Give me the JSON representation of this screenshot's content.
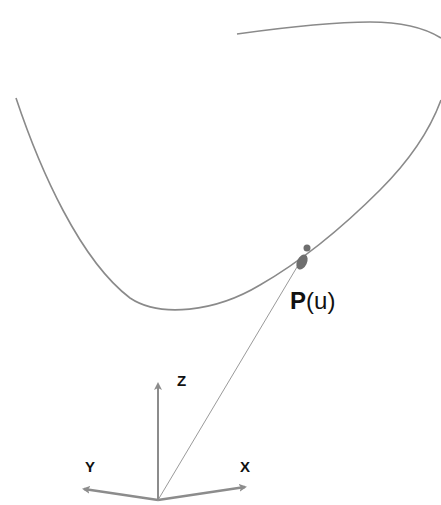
{
  "diagram": {
    "colors": {
      "curve": "#8a8a8a",
      "axes": "#8c8c8c",
      "vector": "#9a9a9a",
      "point": "#6e6e6e",
      "text": "#111111"
    },
    "curve": {
      "name": "parametric-curve",
      "description": "Smooth 3D space curve"
    },
    "point": {
      "symbol": "P",
      "param_open": "(",
      "param": "u",
      "param_close": ")",
      "label": "P(u)"
    },
    "axes": {
      "x_label": "X",
      "y_label": "Y",
      "z_label": "Z"
    }
  }
}
